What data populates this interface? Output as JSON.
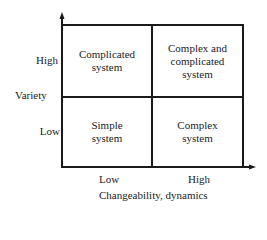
{
  "diagram": {
    "type": "2x2-matrix",
    "y_axis": {
      "title": "Variety",
      "ticks": [
        "High",
        "Low"
      ]
    },
    "x_axis": {
      "title": "Changeability, dynamics",
      "ticks": [
        "Low",
        "High"
      ]
    },
    "quadrants": {
      "top_left": "Complicated\nsystem",
      "top_right": "Complex and\ncomplicated\nsystem",
      "bottom_left": "Simple\nsystem",
      "bottom_right": "Complex\nsystem"
    },
    "colors": {
      "line": "#1a1a1a",
      "text": "#222222",
      "background": "#ffffff"
    }
  }
}
